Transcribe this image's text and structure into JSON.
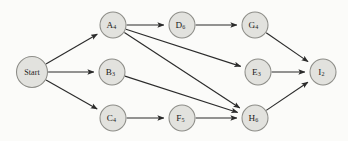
{
  "diagram": {
    "type": "directed-activity-network",
    "background_color": "#fbfbf9",
    "node_fill_color": "#e2e2de",
    "node_stroke_color": "#8d8d88",
    "edge_color": "#2b2b2b",
    "nodes": [
      {
        "id": "start",
        "base": "Start",
        "sub": "",
        "label": "Start",
        "cx": 32,
        "cy": 72,
        "r": 15.5
      },
      {
        "id": "A",
        "base": "A",
        "sub": "4",
        "label": "A4",
        "cx": 113,
        "cy": 25,
        "r": 13.0
      },
      {
        "id": "D",
        "base": "D",
        "sub": "6",
        "label": "D6",
        "cx": 182,
        "cy": 25,
        "r": 13.0
      },
      {
        "id": "G",
        "base": "G",
        "sub": "4",
        "label": "G4",
        "cx": 255,
        "cy": 25,
        "r": 13.0
      },
      {
        "id": "B",
        "base": "B",
        "sub": "3",
        "label": "B3",
        "cx": 112,
        "cy": 72,
        "r": 13.0
      },
      {
        "id": "E",
        "base": "E",
        "sub": "3",
        "label": "E3",
        "cx": 258,
        "cy": 72,
        "r": 13.0
      },
      {
        "id": "I",
        "base": "I",
        "sub": "2",
        "label": "I2",
        "cx": 323,
        "cy": 72,
        "r": 13.0
      },
      {
        "id": "C",
        "base": "C",
        "sub": "4",
        "label": "C4",
        "cx": 113,
        "cy": 118,
        "r": 13.0
      },
      {
        "id": "F",
        "base": "F",
        "sub": "5",
        "label": "F5",
        "cx": 182,
        "cy": 118,
        "r": 13.0
      },
      {
        "id": "H",
        "base": "H",
        "sub": "6",
        "label": "H6",
        "cx": 255,
        "cy": 118,
        "r": 13.0
      }
    ],
    "edges": [
      {
        "from": "start",
        "to": "A"
      },
      {
        "from": "start",
        "to": "B"
      },
      {
        "from": "start",
        "to": "C"
      },
      {
        "from": "A",
        "to": "D"
      },
      {
        "from": "A",
        "to": "E"
      },
      {
        "from": "A",
        "to": "H"
      },
      {
        "from": "D",
        "to": "G"
      },
      {
        "from": "B",
        "to": "H"
      },
      {
        "from": "C",
        "to": "F"
      },
      {
        "from": "F",
        "to": "H"
      },
      {
        "from": "G",
        "to": "I"
      },
      {
        "from": "E",
        "to": "I"
      },
      {
        "from": "H",
        "to": "I"
      }
    ]
  }
}
